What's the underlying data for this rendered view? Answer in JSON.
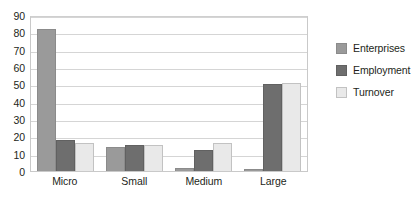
{
  "chart_data": {
    "type": "bar",
    "title": "",
    "subtitle": "",
    "xlabel": "",
    "ylabel": "",
    "categories": [
      "Micro",
      "Small",
      "Medium",
      "Large"
    ],
    "series": [
      {
        "name": "Enterprises",
        "color": "#9a9a9a",
        "values": [
          82,
          14,
          2,
          1
        ]
      },
      {
        "name": "Employment",
        "color": "#6e6e6e",
        "values": [
          18,
          15,
          12,
          50
        ]
      },
      {
        "name": "Turnover",
        "color": "#e9e9e9",
        "values": [
          16,
          15,
          16,
          51
        ]
      }
    ],
    "ylim": [
      0,
      90
    ],
    "ytick_step": 10,
    "yticks": [
      "90",
      "80",
      "70",
      "60",
      "50",
      "40",
      "30",
      "20",
      "10",
      "0"
    ],
    "grid": true,
    "legend_position": "right",
    "orientation": "vertical",
    "grouping": "grouped"
  },
  "legend": {
    "items": [
      {
        "label": "Enterprises"
      },
      {
        "label": "Employment"
      },
      {
        "label": "Turnover"
      }
    ]
  }
}
